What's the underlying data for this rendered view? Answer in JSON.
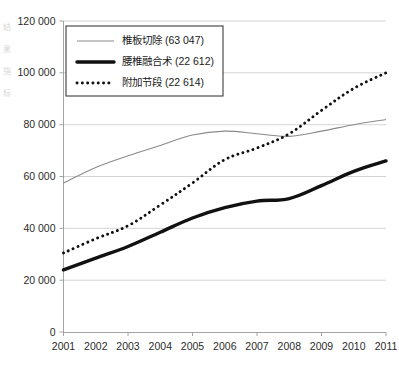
{
  "chart_data": {
    "type": "line",
    "title": "",
    "xlabel": "",
    "ylabel": "",
    "grid": true,
    "legend_position": "top-left",
    "categories": [
      "2001",
      "2002",
      "2003",
      "2004",
      "2005",
      "2006",
      "2007",
      "2008",
      "2009",
      "2010",
      "2011"
    ],
    "x": [
      2001,
      2002,
      2003,
      2004,
      2005,
      2006,
      2007,
      2008,
      2009,
      2010,
      2011
    ],
    "xlim": [
      2001,
      2011
    ],
    "ylim": [
      0,
      120000
    ],
    "ytick_labels": [
      "0",
      "20 000",
      "40 000",
      "60 000",
      "80 000",
      "100 000",
      "120 000"
    ],
    "ytick_values": [
      0,
      20000,
      40000,
      60000,
      80000,
      100000,
      120000
    ],
    "series": [
      {
        "name": "椎板切除 (63 047)",
        "label": "椎板切除",
        "total": "63 047",
        "style": "thin-solid",
        "color": "#8a8a8a",
        "values": [
          57500,
          63500,
          68000,
          72000,
          76000,
          77500,
          76500,
          75500,
          77500,
          80000,
          82000
        ]
      },
      {
        "name": "腰椎融合术 (22 612)",
        "label": "腰椎融合术",
        "total": "22 612",
        "style": "thick-solid",
        "color": "#111111",
        "values": [
          24000,
          28500,
          33000,
          38500,
          44000,
          48000,
          50500,
          51500,
          56500,
          62000,
          66000
        ]
      },
      {
        "name": "附加节段 (22 614)",
        "label": "附加节段",
        "total": "22 614",
        "style": "dotted",
        "color": "#111111",
        "values": [
          30500,
          36000,
          41000,
          49000,
          57500,
          66500,
          71000,
          76500,
          85500,
          94000,
          100000
        ]
      }
    ]
  }
}
